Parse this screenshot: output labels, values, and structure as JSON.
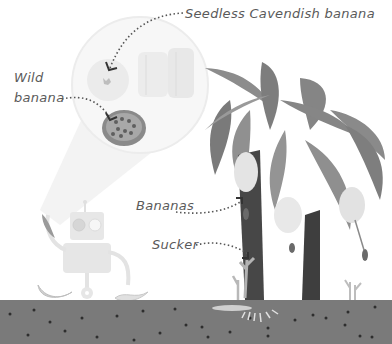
{
  "labels": {
    "seedless": "Seedless Cavendish banana",
    "wild_line1": "Wild",
    "wild_line2": "banana",
    "bananas": "Bananas",
    "sucker": "Sucker"
  },
  "colors": {
    "soil": "#7a7a7a",
    "soil_dots": "#2e2e2e",
    "leaf": "#8c8c8c",
    "leaf_dark": "#6e6e6e",
    "trunk": "#4a4a4a",
    "robot": "#e6e6e6",
    "label_text": "#5a5a5a",
    "beam": "#f4f4f4"
  }
}
